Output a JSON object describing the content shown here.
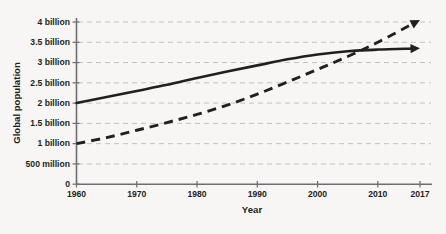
{
  "chart_data": {
    "type": "line",
    "title": "",
    "xlabel": "Year",
    "ylabel": "Global population",
    "xlim": [
      1960,
      2017
    ],
    "ylim": [
      0,
      4000000000
    ],
    "grid": true,
    "legend": "none",
    "x_ticks": [
      1960,
      1970,
      1980,
      1990,
      2000,
      2010,
      2017
    ],
    "x_tick_labels": [
      "1960",
      "1970",
      "1980",
      "1990",
      "2000",
      "2010",
      "2017"
    ],
    "y_ticks": [
      0,
      500000000,
      1000000000,
      1500000000,
      2000000000,
      2500000000,
      3000000000,
      3500000000,
      4000000000
    ],
    "y_tick_labels": [
      "0",
      "500 million",
      "1 billion",
      "1.5 billion",
      "2 billion",
      "2.5 billion",
      "3 billion",
      "3.5 billion",
      "4 billion"
    ],
    "series": [
      {
        "name": "solid-series",
        "style": "solid",
        "arrow_end": true,
        "x": [
          1960,
          1965,
          1970,
          1975,
          1980,
          1985,
          1990,
          1995,
          2000,
          2005,
          2010,
          2017
        ],
        "values": [
          2000000000,
          2150000000,
          2300000000,
          2450000000,
          2620000000,
          2780000000,
          2930000000,
          3080000000,
          3200000000,
          3280000000,
          3320000000,
          3350000000
        ]
      },
      {
        "name": "dashed-series",
        "style": "dashed",
        "arrow_end": true,
        "x": [
          1960,
          1965,
          1970,
          1975,
          1980,
          1985,
          1990,
          1995,
          2000,
          2005,
          2010,
          2017
        ],
        "values": [
          1000000000,
          1150000000,
          1330000000,
          1520000000,
          1720000000,
          1950000000,
          2220000000,
          2520000000,
          2830000000,
          3150000000,
          3500000000,
          4050000000
        ]
      }
    ],
    "annotations": [
      {
        "name": "series-crossover",
        "x": 2008,
        "y": 3300000000
      }
    ]
  },
  "bleed_text": {
    "line1": "",
    "line2": "",
    "line3": "",
    "line4": ""
  }
}
